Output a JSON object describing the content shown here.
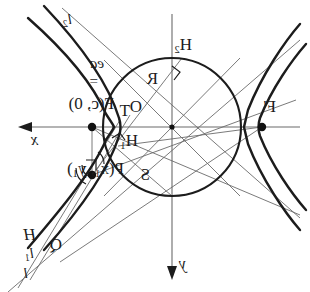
{
  "figure": {
    "kind": "geometry-diagram",
    "mirrored": true,
    "width": 310,
    "height": 292,
    "stroke_color": "#1c1c1c",
    "thin_stroke_color": "#555555",
    "background": "#ffffff"
  },
  "axes": {
    "x": {
      "label": "x",
      "arrow_direction": "left",
      "y_pixel": 127
    },
    "y": {
      "label": "y",
      "arrow_direction": "down",
      "x_pixel": 172
    },
    "origin": {
      "label": "O",
      "x": 172,
      "y": 127
    }
  },
  "circle": {
    "center_x": 172,
    "center_y": 127,
    "radius": 69
  },
  "points": [
    {
      "id": "O",
      "label": "O",
      "x": 172,
      "y": 127,
      "dot": false
    },
    {
      "id": "F",
      "label": "F(c, 0)",
      "x": 92,
      "y": 127,
      "dot": true
    },
    {
      "id": "Fp",
      "label": "F'",
      "x": 262,
      "y": 127,
      "dot": true
    },
    {
      "id": "P",
      "label": "P(x1, y1)",
      "x": 92,
      "y": 175,
      "dot": true
    },
    {
      "id": "H1",
      "label": "H1",
      "x": 118,
      "y": 143,
      "dot": false
    },
    {
      "id": "H2",
      "label": "H2",
      "x": 180,
      "y": 60,
      "dot": false
    },
    {
      "id": "R",
      "label": "R",
      "x": 146,
      "y": 86,
      "dot": false
    },
    {
      "id": "S",
      "label": "S",
      "x": 140,
      "y": 178,
      "dot": false
    },
    {
      "id": "T",
      "label": "T",
      "x": 124,
      "y": 120,
      "dot": false
    },
    {
      "id": "Q",
      "label": "Q",
      "x": 52,
      "y": 248,
      "dot": false
    },
    {
      "id": "H",
      "label": "H",
      "x": 22,
      "y": 240,
      "dot": false
    }
  ],
  "labels": {
    "point_O": "O",
    "point_F": "F(c, 0)",
    "point_F_prime": "F'",
    "point_P": "P(x",
    "point_P_sub1": "1",
    "point_P_mid": ", y",
    "point_P_sub2": "1",
    "point_P_end": ")",
    "point_H1_base": "H",
    "point_H1_sub": "1",
    "point_H2_base": "H",
    "point_H2_sub": "2",
    "point_R": "R",
    "point_S": "S",
    "point_T": "T",
    "point_Q": "Q",
    "point_H": "H",
    "line_l": "l",
    "line_l1_base": "l",
    "line_l1_sub": "1",
    "line_l2_base": "l",
    "line_l2_sub": "2",
    "axis_x": "x",
    "axis_y": "y",
    "formula_equals": "=",
    "formula_value": "ea"
  }
}
